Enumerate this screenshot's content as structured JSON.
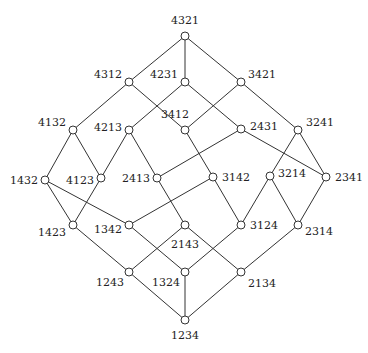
{
  "diagram": {
    "nodes": [
      {
        "id": "4321",
        "x": 185,
        "y": 36,
        "lx": 185,
        "ly": 24,
        "anchor": "middle"
      },
      {
        "id": "4312",
        "x": 129,
        "y": 82,
        "lx": 122,
        "ly": 78,
        "anchor": "end"
      },
      {
        "id": "4231",
        "x": 185,
        "y": 82,
        "lx": 178,
        "ly": 78,
        "anchor": "end"
      },
      {
        "id": "3421",
        "x": 241,
        "y": 82,
        "lx": 248,
        "ly": 78,
        "anchor": "start"
      },
      {
        "id": "4132",
        "x": 73,
        "y": 130,
        "lx": 66,
        "ly": 126,
        "anchor": "end"
      },
      {
        "id": "4213",
        "x": 129,
        "y": 130,
        "lx": 122,
        "ly": 131,
        "anchor": "end"
      },
      {
        "id": "3412",
        "x": 185,
        "y": 130,
        "lx": 175,
        "ly": 118,
        "anchor": "middle"
      },
      {
        "id": "2431",
        "x": 241,
        "y": 129,
        "lx": 250,
        "ly": 130,
        "anchor": "start"
      },
      {
        "id": "3241",
        "x": 298,
        "y": 130,
        "lx": 306,
        "ly": 126,
        "anchor": "start"
      },
      {
        "id": "1432",
        "x": 45,
        "y": 180,
        "lx": 38,
        "ly": 184,
        "anchor": "end"
      },
      {
        "id": "4123",
        "x": 101,
        "y": 178,
        "lx": 94,
        "ly": 184,
        "anchor": "end"
      },
      {
        "id": "2413",
        "x": 157,
        "y": 178,
        "lx": 150,
        "ly": 182,
        "anchor": "end"
      },
      {
        "id": "3142",
        "x": 213,
        "y": 177,
        "lx": 222,
        "ly": 181,
        "anchor": "start"
      },
      {
        "id": "3214",
        "x": 270,
        "y": 176,
        "lx": 278,
        "ly": 177,
        "anchor": "start"
      },
      {
        "id": "2341",
        "x": 326,
        "y": 177,
        "lx": 335,
        "ly": 181,
        "anchor": "start"
      },
      {
        "id": "1423",
        "x": 73,
        "y": 225,
        "lx": 66,
        "ly": 236,
        "anchor": "end"
      },
      {
        "id": "1342",
        "x": 129,
        "y": 225,
        "lx": 122,
        "ly": 233,
        "anchor": "end"
      },
      {
        "id": "2143",
        "x": 185,
        "y": 225,
        "lx": 185,
        "ly": 248,
        "anchor": "middle"
      },
      {
        "id": "3124",
        "x": 241,
        "y": 225,
        "lx": 250,
        "ly": 229,
        "anchor": "start"
      },
      {
        "id": "2314",
        "x": 298,
        "y": 225,
        "lx": 305,
        "ly": 235,
        "anchor": "start"
      },
      {
        "id": "1243",
        "x": 129,
        "y": 272,
        "lx": 124,
        "ly": 286,
        "anchor": "end"
      },
      {
        "id": "1324",
        "x": 185,
        "y": 272,
        "lx": 180,
        "ly": 286,
        "anchor": "end"
      },
      {
        "id": "2134",
        "x": 241,
        "y": 272,
        "lx": 248,
        "ly": 287,
        "anchor": "start"
      },
      {
        "id": "1234",
        "x": 185,
        "y": 320,
        "lx": 185,
        "ly": 339,
        "anchor": "middle"
      }
    ],
    "edges": [
      [
        "4321",
        "4312"
      ],
      [
        "4321",
        "4231"
      ],
      [
        "4321",
        "3421"
      ],
      [
        "4312",
        "4132"
      ],
      [
        "4312",
        "3412"
      ],
      [
        "4231",
        "4213"
      ],
      [
        "4231",
        "2431"
      ],
      [
        "3421",
        "3412"
      ],
      [
        "3421",
        "3241"
      ],
      [
        "4132",
        "1432"
      ],
      [
        "4132",
        "4123"
      ],
      [
        "4213",
        "4123"
      ],
      [
        "4213",
        "2413"
      ],
      [
        "3412",
        "3142"
      ],
      [
        "2431",
        "2413"
      ],
      [
        "2431",
        "2341"
      ],
      [
        "3241",
        "3214"
      ],
      [
        "3241",
        "2341"
      ],
      [
        "1432",
        "1423"
      ],
      [
        "1432",
        "1342"
      ],
      [
        "4123",
        "1423"
      ],
      [
        "2413",
        "2143"
      ],
      [
        "3142",
        "1342"
      ],
      [
        "3142",
        "3124"
      ],
      [
        "3214",
        "3124"
      ],
      [
        "3214",
        "2314"
      ],
      [
        "2341",
        "2314"
      ],
      [
        "1423",
        "1243"
      ],
      [
        "1342",
        "1324"
      ],
      [
        "2143",
        "1243"
      ],
      [
        "2143",
        "2134"
      ],
      [
        "3124",
        "1324"
      ],
      [
        "2314",
        "2134"
      ],
      [
        "1243",
        "1234"
      ],
      [
        "1324",
        "1234"
      ],
      [
        "2134",
        "1234"
      ]
    ],
    "style": {
      "node_radius": 4,
      "stroke_color": "#333333",
      "node_fill": "#ffffff",
      "background": "#ffffff"
    }
  }
}
